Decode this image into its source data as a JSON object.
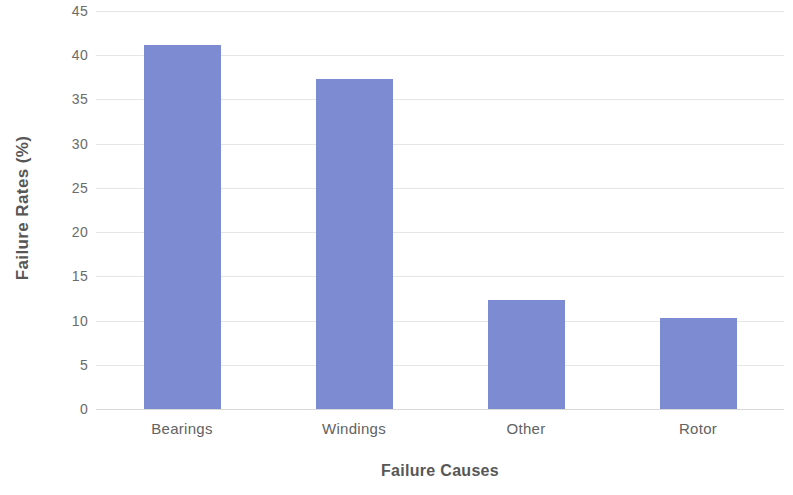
{
  "chart_data": {
    "type": "bar",
    "title": "",
    "categories": [
      "Bearings",
      "Windings",
      "Other",
      "Rotor"
    ],
    "values": [
      41.2,
      37.3,
      12.3,
      10.3
    ],
    "series": [
      {
        "name": "Failure Rates (%)",
        "values": [
          41.2,
          37.3,
          12.3,
          10.3
        ]
      }
    ],
    "xlabel": "Failure Causes",
    "ylabel": "Failure Rates (%)",
    "ylim": [
      0,
      45
    ],
    "ytick_step": 5,
    "yticks": [
      0,
      5,
      10,
      15,
      20,
      25,
      30,
      35,
      40,
      45
    ],
    "ytick_labels": [
      "0",
      "5",
      "10",
      "15",
      "20",
      "25",
      "30",
      "35",
      "40",
      "45"
    ],
    "grid": "horizontal",
    "legend": "none",
    "bar_color": "#7c8bd2",
    "gridline_color": "#e6e6e6",
    "background_color": "#ffffff",
    "text_color": "#5a5a5a"
  }
}
